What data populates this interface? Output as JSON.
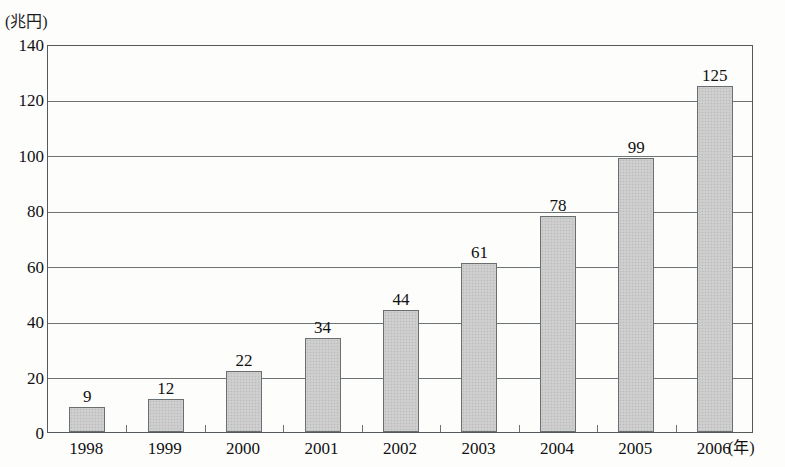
{
  "chart_data": {
    "type": "bar",
    "title": "",
    "subtitle": "",
    "xlabel": "(年)",
    "ylabel": "(兆円)",
    "categories": [
      "1998",
      "1999",
      "2000",
      "2001",
      "2002",
      "2003",
      "2004",
      "2005",
      "2006"
    ],
    "values": [
      9,
      12,
      22,
      34,
      44,
      61,
      78,
      99,
      125
    ],
    "value_labels": [
      "9",
      "12",
      "22",
      "34",
      "44",
      "61",
      "78",
      "99",
      "125"
    ],
    "ylim": [
      0,
      140
    ],
    "ytick_values": [
      0,
      20,
      40,
      60,
      80,
      100,
      120,
      140
    ],
    "ytick_labels": [
      "0",
      "20",
      "40",
      "60",
      "80",
      "100",
      "120",
      "140"
    ],
    "grid": true,
    "grid_axis": "y",
    "legend": false,
    "legend_position": "none",
    "bar_fill_color": "#cbcbcb",
    "bar_border_color": "#6a6f72",
    "axis_color": "#555a5c",
    "grid_color": "#6d7275",
    "text_color": "#111111",
    "background_color": "#fdfdfc"
  }
}
